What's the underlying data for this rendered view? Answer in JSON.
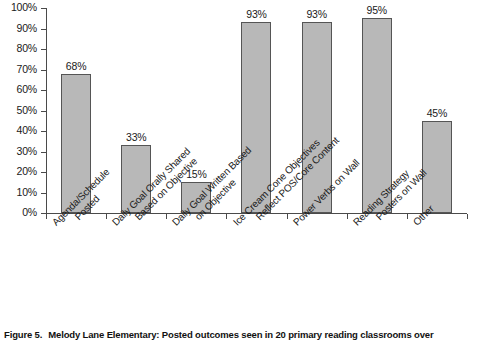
{
  "caption": {
    "figure_label": "Figure 5.",
    "text": "Melody Lane Elementary:  Posted outcomes seen in 20 primary reading classrooms over"
  },
  "chart_data": {
    "type": "bar",
    "title": "",
    "xlabel": "",
    "ylabel": "",
    "ylim": [
      0,
      100
    ],
    "ytick_labels": [
      "0%",
      "10%",
      "20%",
      "30%",
      "40%",
      "50%",
      "60%",
      "70%",
      "80%",
      "90%",
      "100%"
    ],
    "ytick_values": [
      0,
      10,
      20,
      30,
      40,
      50,
      60,
      70,
      80,
      90,
      100
    ],
    "grid": false,
    "legend": false,
    "value_label_suffix": "%",
    "bar_color": "#b8b8b8",
    "bar_border_color": "#555555",
    "axis_color": "#4a4a4a",
    "categories": [
      "Agenda/Schedule Posted",
      "Daily Goal Orally Shared Based on Objective",
      "Daily Goal Written Based on Objective",
      "Ice Cream Cone Objectives Reflect POS/Core Content",
      "Power Verbs on Wall",
      "Reading Strategy Posters on Wall",
      "Other"
    ],
    "category_lines": [
      [
        "Agenda/Schedule",
        "Posted"
      ],
      [
        "Daily Goal Orally Shared",
        "Based on Objective"
      ],
      [
        "Daily Goal Written Based",
        "on Objective"
      ],
      [
        "Ice Cream Cone Objectives",
        "Reflect POS/Core Content"
      ],
      [
        "Power Verbs on Wall"
      ],
      [
        "Reading Strategy",
        "Posters on Wall"
      ],
      [
        "Other"
      ]
    ],
    "values": [
      68,
      33,
      15,
      93,
      93,
      95,
      45
    ],
    "value_labels": [
      "68%",
      "33%",
      "15%",
      "93%",
      "93%",
      "95%",
      "45%"
    ]
  }
}
